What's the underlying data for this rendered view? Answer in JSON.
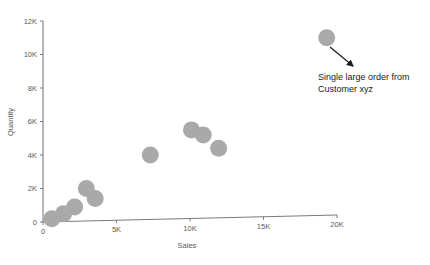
{
  "chart_data": {
    "type": "scatter",
    "title": "",
    "xlabel": "Sales",
    "ylabel": "Quantity",
    "xlim": [
      0,
      20000
    ],
    "ylim": [
      0,
      12000
    ],
    "grid": false,
    "legend": false,
    "x_ticks": [
      0,
      5000,
      10000,
      15000,
      20000
    ],
    "x_tick_labels": [
      "0",
      "5K",
      "10K",
      "15K",
      "20K"
    ],
    "y_ticks": [
      0,
      2000,
      4000,
      6000,
      8000,
      10000,
      12000
    ],
    "y_tick_labels": [
      "0",
      "2K",
      "4K",
      "6K",
      "8K",
      "10K",
      "12K"
    ],
    "marker_color": "#a9a9a9",
    "marker_size": 17,
    "points": [
      {
        "x": 600,
        "y": 200
      },
      {
        "x": 1400,
        "y": 500
      },
      {
        "x": 2150,
        "y": 900
      },
      {
        "x": 2950,
        "y": 2000
      },
      {
        "x": 3550,
        "y": 1400
      },
      {
        "x": 7300,
        "y": 4000
      },
      {
        "x": 10100,
        "y": 5500
      },
      {
        "x": 10900,
        "y": 5200
      },
      {
        "x": 11950,
        "y": 4400
      },
      {
        "x": 19300,
        "y": 11000
      }
    ],
    "annotations": [
      {
        "id": "outlier-callout",
        "lines": [
          "Single large order from",
          "Customer xyz"
        ],
        "text": "Single large order from Customer xyz",
        "text_x": 318,
        "text_y": 77,
        "arrow_from_x": 330,
        "arrow_from_y": 47,
        "arrow_to_x": 355,
        "arrow_to_y": 68,
        "color": "#1a1a1a"
      }
    ],
    "axis_color": "#7a7a7a"
  },
  "axes": {
    "x_title": "Sales",
    "y_title": "Quantity"
  }
}
